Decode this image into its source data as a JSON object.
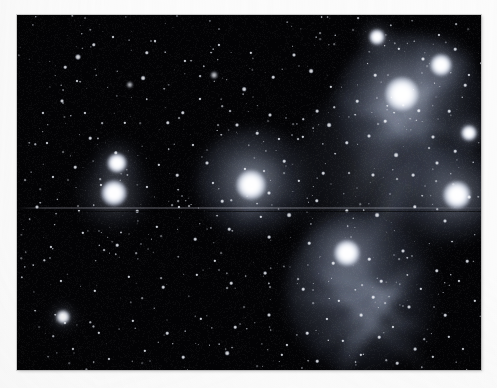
{
  "image": {
    "kind": "astrophotograph",
    "subject": "Pleiades open star cluster (M45) with reflection nebulosity",
    "frame": {
      "canvas_width": 497,
      "canvas_height": 388,
      "plate_left": 17,
      "plate_top": 15,
      "plate_width": 464,
      "plate_height": 355,
      "border_color": "#fbfbfb",
      "sky_color": "#030305",
      "nebula_tint": "#9fb0cf",
      "star_color": "#ffffff"
    },
    "artifacts": {
      "scanline_y": 192,
      "scanline_label": "horizontal scan-line artifact"
    }
  },
  "bright_stars": [
    {
      "name": "alcyone",
      "x": 385,
      "y": 79,
      "r": 17,
      "glow": 62,
      "mag": 1.0
    },
    {
      "name": "atlas",
      "x": 97,
      "y": 178,
      "r": 13,
      "glow": 40,
      "mag": 0.92
    },
    {
      "name": "pleione",
      "x": 100,
      "y": 148,
      "r": 10,
      "glow": 26,
      "mag": 0.8
    },
    {
      "name": "electra",
      "x": 234,
      "y": 170,
      "r": 15,
      "glow": 52,
      "mag": 0.96
    },
    {
      "name": "maia",
      "x": 440,
      "y": 180,
      "r": 14,
      "glow": 48,
      "mag": 0.94
    },
    {
      "name": "merope",
      "x": 330,
      "y": 238,
      "r": 13,
      "glow": 44,
      "mag": 0.93
    },
    {
      "name": "taygeta",
      "x": 424,
      "y": 50,
      "r": 11,
      "glow": 32,
      "mag": 0.88
    },
    {
      "name": "celaeno",
      "x": 452,
      "y": 118,
      "r": 8,
      "glow": 22,
      "mag": 0.82
    },
    {
      "name": "asterope",
      "x": 360,
      "y": 22,
      "r": 8,
      "glow": 20,
      "mag": 0.8
    },
    {
      "name": "star-18-tauri",
      "x": 46,
      "y": 302,
      "r": 7,
      "glow": 16,
      "mag": 0.78
    }
  ],
  "nebula_patches": [
    {
      "name": "merope-nebula",
      "x": 345,
      "y": 280,
      "w": 150,
      "h": 160,
      "intensity": 0.4,
      "rot": -18
    },
    {
      "name": "maia-nebula",
      "x": 395,
      "y": 95,
      "w": 155,
      "h": 150,
      "intensity": 0.36,
      "rot": 10
    },
    {
      "name": "electra-nebula",
      "x": 238,
      "y": 168,
      "w": 120,
      "h": 110,
      "intensity": 0.26,
      "rot": 0
    },
    {
      "name": "alcyone-haze",
      "x": 430,
      "y": 180,
      "w": 120,
      "h": 100,
      "intensity": 0.24,
      "rot": 0
    },
    {
      "name": "bridging-haze",
      "x": 360,
      "y": 175,
      "w": 170,
      "h": 210,
      "intensity": 0.14,
      "rot": -8
    }
  ],
  "accessibility": {
    "alt_text": "Black-and-white astronomical photograph of the Pleiades star cluster showing bright stars wrapped in wispy reflection nebulosity against a dense star field, printed with a white border."
  }
}
